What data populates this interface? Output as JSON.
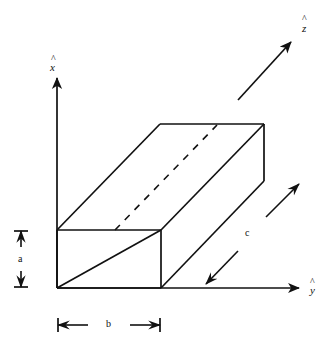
{
  "figure": {
    "kind": "3d-rectangular-box-oblique-projection",
    "background_color": "#ffffff",
    "line_color": "#111111"
  },
  "axes": {
    "x": {
      "label": "x",
      "hat": "^",
      "description": "vertical axis pointing up",
      "arrow_from": [
        57,
        288
      ],
      "arrow_to": [
        57,
        77
      ]
    },
    "y": {
      "label": "y",
      "hat": "^",
      "description": "horizontal axis pointing right",
      "arrow_from": [
        57,
        288
      ],
      "arrow_to": [
        300,
        288
      ]
    },
    "z": {
      "label": "z",
      "hat": "^",
      "description": "oblique axis pointing up-right",
      "arrow_from": [
        238,
        100
      ],
      "arrow_to": [
        292,
        41
      ]
    }
  },
  "dimensions": {
    "a": {
      "label": "a",
      "orientation": "vertical",
      "description": "box height along x"
    },
    "b": {
      "label": "b",
      "orientation": "horizontal",
      "description": "box width along y"
    },
    "c": {
      "label": "c",
      "orientation": "oblique",
      "description": "box length along z"
    }
  },
  "box": {
    "front_bottom_left": [
      57,
      288
    ],
    "front_bottom_right": [
      161,
      288
    ],
    "front_top_left": [
      57,
      230
    ],
    "front_top_right": [
      161,
      230
    ],
    "back_top_left": [
      160,
      124
    ],
    "back_top_right": [
      264,
      124
    ],
    "back_bottom_right": [
      264,
      181
    ],
    "hidden_edge_from": [
      115,
      230
    ],
    "hidden_edge_to": [
      218,
      124
    ]
  }
}
